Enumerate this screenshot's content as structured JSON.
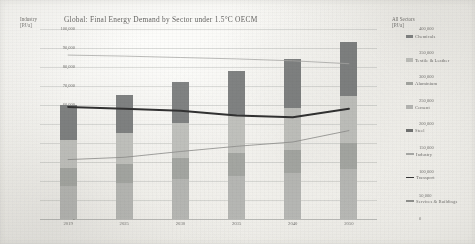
{
  "chart_data": {
    "type": "bar",
    "title": "Global: Final Energy Demand by Sector under 1.5°C OECM",
    "categories": [
      "2019",
      "2025",
      "2030",
      "2035",
      "2040",
      "2050"
    ],
    "xlabel": "",
    "ylabel": "Industry [PJ/a]",
    "y2label": "All Sectors [PJ/a]",
    "ylim": [
      0,
      100000
    ],
    "y2lim": [
      0,
      400000
    ],
    "yticks": [
      "0",
      "10,000",
      "20,000",
      "30,000",
      "40,000",
      "50,000",
      "60,000",
      "70,000",
      "80,000",
      "90,000",
      "100,000"
    ],
    "y2ticks": [
      "0",
      "50,000",
      "100,000",
      "150,000",
      "200,000",
      "250,000",
      "300,000",
      "350,000",
      "400,000"
    ],
    "grid": true,
    "legend_position": "right",
    "stacked": true,
    "series": [
      {
        "name": "Cement",
        "kind": "bar",
        "axis": "left",
        "color": "#b9bab6",
        "values": [
          17500,
          19000,
          21000,
          22500,
          24000,
          26500
        ]
      },
      {
        "name": "Aluminium",
        "kind": "bar",
        "axis": "left",
        "color": "#a6a8a4",
        "values": [
          9500,
          10000,
          11000,
          12000,
          12500,
          13500
        ]
      },
      {
        "name": "Textile & Leather",
        "kind": "bar",
        "axis": "left",
        "color": "#c3c4c0",
        "values": [
          14500,
          16500,
          18500,
          20500,
          22000,
          25000
        ]
      },
      {
        "name": "Chemicals",
        "kind": "bar",
        "axis": "left",
        "color": "#7e8080",
        "values": [
          18500,
          20000,
          21500,
          23000,
          25500,
          28000
        ]
      },
      {
        "name": "Industry",
        "kind": "line",
        "axis": "right",
        "color": "#a9aaa7",
        "values": [
          345000,
          343000,
          340000,
          337000,
          333000,
          327000
        ]
      },
      {
        "name": "Transport",
        "kind": "line",
        "axis": "right",
        "color": "#2c2c2c",
        "values": [
          236000,
          232000,
          228000,
          218000,
          214000,
          232000
        ]
      },
      {
        "name": "Services & Buildings",
        "kind": "line",
        "axis": "right",
        "color": "#8b8c89",
        "values": [
          125000,
          130000,
          142000,
          153000,
          162000,
          186000
        ]
      }
    ],
    "legend": [
      {
        "label": "Chemicals",
        "swatch": "bar",
        "color": "#7e8080"
      },
      {
        "label": "Textile & Leather",
        "swatch": "bar",
        "color": "#c3c4c0"
      },
      {
        "label": "Aluminium",
        "swatch": "bar",
        "color": "#a6a8a4"
      },
      {
        "label": "Cement",
        "swatch": "bar",
        "color": "#b9bab6"
      },
      {
        "label": "Steel",
        "swatch": "bar",
        "color": "#6f7170"
      },
      {
        "label": "Industry",
        "swatch": "line",
        "color": "#a9aaa7"
      },
      {
        "label": "Transport",
        "swatch": "line-bold",
        "color": "#2c2c2c"
      },
      {
        "label": "Services & Buildings",
        "swatch": "line",
        "color": "#8b8c89"
      }
    ]
  },
  "axes": {
    "left_caption_line1": "Industry",
    "left_caption_line2": "[PJ/a]",
    "right_caption_line1": "All Sectors",
    "right_caption_line2": "[PJ/a]"
  },
  "colors": {
    "grid": "#969896",
    "text": "#6a6967",
    "transport_line": "#2c2c2c"
  }
}
